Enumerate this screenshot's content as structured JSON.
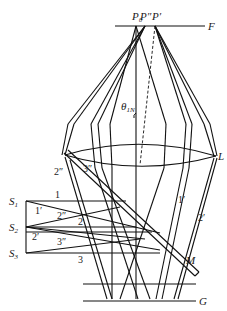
{
  "diagram": {
    "title": "",
    "planes": {
      "focal_plane": {
        "label": "F",
        "points": [
          "P″",
          "P₀",
          "P′"
        ]
      },
      "lens": {
        "label": "L"
      },
      "mirror": {
        "label": "M"
      },
      "ground_plane": {
        "label": "G"
      }
    },
    "angle_label": "θ",
    "angle_subscript": "1N",
    "sources": [
      {
        "label": "S",
        "sub": "1"
      },
      {
        "label": "S",
        "sub": "2"
      },
      {
        "label": "S",
        "sub": "3"
      }
    ],
    "ray_labels": {
      "r1": "1",
      "r1p": "1′",
      "r2": "2",
      "r2p": "2′",
      "r2pp": "2″",
      "r3": "3",
      "r3pp": "3″",
      "r1p_right": "1′",
      "r2p_right": "2′",
      "r2pp_left": "2″",
      "r3pp_upper": "3″"
    },
    "colors": {
      "stroke": "#111111",
      "background": "#ffffff"
    }
  }
}
